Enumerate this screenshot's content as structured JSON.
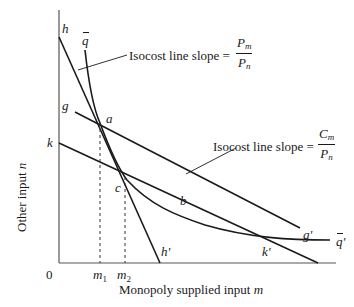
{
  "diagram": {
    "axes": {
      "x_label": "Monopoly supplied input ",
      "x_label_var": "m",
      "y_label": "Other input ",
      "y_label_var": "n",
      "origin": "0"
    },
    "ticks": {
      "m1": {
        "base": "m",
        "sub": "1"
      },
      "m2": {
        "base": "m",
        "sub": "2"
      }
    },
    "lines": {
      "h_start": "h",
      "h_end": "h'",
      "g_start": "g",
      "g_end": "g'",
      "k_start": "k",
      "k_end": "k'",
      "q_start": "q",
      "q_end": "q",
      "q_end_prime": "'"
    },
    "points": {
      "a": "a",
      "b": "b",
      "c": "c"
    },
    "annotations": {
      "isocost_top": {
        "text": "Isocost line slope = ",
        "num_base": "P",
        "num_sub": "m",
        "den_base": "P",
        "den_sub": "n"
      },
      "isocost_right": {
        "text": "Isocost line slope = ",
        "num_base": "C",
        "num_sub": "m",
        "den_base": "P",
        "den_sub": "n"
      }
    },
    "colors": {
      "line": "#1a1a1a",
      "axis": "#555555",
      "background": "#ffffff"
    }
  }
}
